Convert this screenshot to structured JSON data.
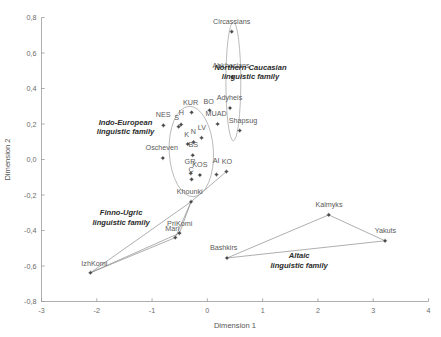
{
  "chart_data": {
    "type": "scatter",
    "title": "",
    "xlabel": "Dimension 1",
    "ylabel": "Dimension 2",
    "xlim": [
      -3,
      4
    ],
    "ylim": [
      -0.8,
      0.8
    ],
    "xticks": [
      "-3",
      "-2",
      "-1",
      "0",
      "1",
      "2",
      "3",
      "4"
    ],
    "xtick_values": [
      -3,
      -2,
      -1,
      0,
      1,
      2,
      3,
      4
    ],
    "yticks": [
      "0,8",
      "0,6",
      "0,4",
      "0,2",
      "0,0",
      "-0,2",
      "-0,4",
      "-0,6",
      "-0,8"
    ],
    "ytick_values": [
      0.8,
      0.6,
      0.4,
      0.2,
      0.0,
      -0.2,
      -0.4,
      -0.6,
      -0.8
    ],
    "grid": false,
    "legend": "none",
    "decimal_separator": ",",
    "points": [
      {
        "label": "Circassians",
        "x": 0.44,
        "y": 0.72,
        "lx": 0.44,
        "ly": 0.765,
        "anchor": "middle",
        "group": "northern-caucasian"
      },
      {
        "label": "Abkhasians",
        "x": 0.45,
        "y": 0.465,
        "lx": 0.43,
        "ly": 0.513,
        "anchor": "middle",
        "group": "northern-caucasian"
      },
      {
        "label": "Adyheis",
        "x": 0.41,
        "y": 0.29,
        "lx": 0.4,
        "ly": 0.335,
        "anchor": "middle",
        "group": "northern-caucasian"
      },
      {
        "label": "Shapsug",
        "x": 0.585,
        "y": 0.163,
        "lx": 0.645,
        "ly": 0.205,
        "anchor": "middle",
        "group": "northern-caucasian"
      },
      {
        "label": "KUR",
        "x": -0.285,
        "y": 0.265,
        "lx": -0.305,
        "ly": 0.305,
        "anchor": "middle",
        "group": "indo-european"
      },
      {
        "label": "BO",
        "x": 0.04,
        "y": 0.277,
        "lx": 0.025,
        "ly": 0.313,
        "anchor": "middle",
        "group": "indo-european"
      },
      {
        "label": "MUAD",
        "x": 0.185,
        "y": 0.2,
        "lx": 0.16,
        "ly": 0.245,
        "anchor": "middle",
        "group": "indo-european"
      },
      {
        "label": "NES",
        "x": -0.795,
        "y": 0.192,
        "lx": -0.8,
        "ly": 0.237,
        "anchor": "middle",
        "group": "indo-european"
      },
      {
        "label": "S",
        "x": -0.52,
        "y": 0.185,
        "lx": -0.555,
        "ly": 0.222,
        "anchor": "middle",
        "group": "indo-european"
      },
      {
        "label": "H",
        "x": -0.475,
        "y": 0.197,
        "lx": -0.472,
        "ly": 0.248,
        "anchor": "middle",
        "group": "indo-european"
      },
      {
        "label": "LV",
        "x": -0.105,
        "y": 0.122,
        "lx": -0.1,
        "ly": 0.168,
        "anchor": "middle",
        "group": "indo-european"
      },
      {
        "label": "N",
        "x": -0.25,
        "y": 0.098,
        "lx": -0.253,
        "ly": 0.143,
        "anchor": "middle",
        "group": "indo-european"
      },
      {
        "label": "K",
        "x": -0.355,
        "y": 0.087,
        "lx": -0.375,
        "ly": 0.127,
        "anchor": "middle",
        "group": "indo-european"
      },
      {
        "label": "BS",
        "x": -0.265,
        "y": 0.024,
        "lx": -0.255,
        "ly": 0.068,
        "anchor": "middle",
        "group": "indo-european"
      },
      {
        "label": "Oscheven",
        "x": -0.805,
        "y": 0.008,
        "lx": -0.825,
        "ly": 0.052,
        "anchor": "middle",
        "group": "indo-european"
      },
      {
        "label": "AI",
        "x": 0.165,
        "y": -0.085,
        "lx": 0.16,
        "ly": -0.02,
        "anchor": "middle",
        "group": "indo-european"
      },
      {
        "label": "KO",
        "x": 0.345,
        "y": -0.068,
        "lx": 0.355,
        "ly": -0.028,
        "anchor": "middle",
        "group": "indo-european"
      },
      {
        "label": "GR",
        "x": -0.3,
        "y": -0.078,
        "lx": -0.315,
        "ly": -0.025,
        "anchor": "middle",
        "group": "indo-european"
      },
      {
        "label": "C",
        "x": -0.285,
        "y": -0.112,
        "lx": -0.295,
        "ly": -0.072,
        "anchor": "middle",
        "group": "indo-european"
      },
      {
        "label": "KOS",
        "x": -0.135,
        "y": -0.088,
        "lx": -0.135,
        "ly": -0.045,
        "anchor": "middle",
        "group": "indo-european"
      },
      {
        "label": "Khounki",
        "x": -0.295,
        "y": -0.238,
        "lx": -0.32,
        "ly": -0.193,
        "anchor": "middle",
        "group": "finno-ugric"
      },
      {
        "label": "PriKomi",
        "x": -0.505,
        "y": -0.415,
        "lx": -0.5,
        "ly": -0.372,
        "anchor": "middle",
        "group": "finno-ugric"
      },
      {
        "label": "Mari",
        "x": -0.58,
        "y": -0.44,
        "lx": -0.635,
        "ly": -0.4,
        "anchor": "middle",
        "group": "finno-ugric"
      },
      {
        "label": "IzhKomi",
        "x": -2.115,
        "y": -0.638,
        "lx": -2.045,
        "ly": -0.598,
        "anchor": "middle",
        "group": "finno-ugric"
      },
      {
        "label": "Kalmyks",
        "x": 2.195,
        "y": -0.312,
        "lx": 2.2,
        "ly": -0.268,
        "anchor": "middle",
        "group": "altaic"
      },
      {
        "label": "Yakuts",
        "x": 3.215,
        "y": -0.458,
        "lx": 3.22,
        "ly": -0.412,
        "anchor": "middle",
        "group": "altaic"
      },
      {
        "label": "Bashkirs",
        "x": 0.355,
        "y": -0.555,
        "lx": 0.295,
        "ly": -0.512,
        "anchor": "middle",
        "group": "altaic"
      }
    ],
    "family_annotations": [
      {
        "id": "northern-caucasian",
        "line1": "Northern Caucasian",
        "line2": "linguistic family",
        "x": 0.78,
        "y": 0.505
      },
      {
        "id": "indo-european",
        "line1": "Indo-European",
        "line2": "linguistic family",
        "x": -1.48,
        "y": 0.195
      },
      {
        "id": "finno-ugric",
        "line1": "Finno-Ugric",
        "line2": "linguistic family",
        "x": -1.56,
        "y": -0.315
      },
      {
        "id": "altaic",
        "line1": "Altaic",
        "line2": "linguistic family",
        "x": 1.66,
        "y": -0.555
      }
    ],
    "hulls": [
      {
        "id": "finno-ugric-hull",
        "points": [
          [
            -0.295,
            -0.238
          ],
          [
            -0.505,
            -0.415
          ],
          [
            -2.115,
            -0.638
          ],
          [
            -0.295,
            -0.238
          ]
        ]
      },
      {
        "id": "finno-ugric-hull-2",
        "points": [
          [
            -2.115,
            -0.638
          ],
          [
            -0.58,
            -0.44
          ],
          [
            -0.295,
            -0.238
          ]
        ]
      },
      {
        "id": "indo-european-tail",
        "points": [
          [
            0.345,
            -0.068
          ],
          [
            -0.295,
            -0.238
          ]
        ]
      },
      {
        "id": "altaic-hull",
        "points": [
          [
            0.355,
            -0.555
          ],
          [
            2.195,
            -0.312
          ],
          [
            3.215,
            -0.458
          ],
          [
            0.355,
            -0.555
          ]
        ]
      }
    ],
    "ellipses": [
      {
        "id": "indo-european-ellipse",
        "cx": -0.29,
        "cy": 0.045,
        "rx": 0.4,
        "ry": 0.255,
        "rotate": -3
      },
      {
        "id": "northern-caucasian-ellipse",
        "cx": 0.47,
        "cy": 0.44,
        "rx": 0.135,
        "ry": 0.335,
        "rotate": 0
      }
    ]
  },
  "colors": {
    "background": "#ffffff",
    "axis": "#9a9a9a",
    "marker": "#4a4a4a",
    "label": "#5a5a5a",
    "annotation": "#2b2b2b",
    "hull": "#8d8d8d"
  }
}
